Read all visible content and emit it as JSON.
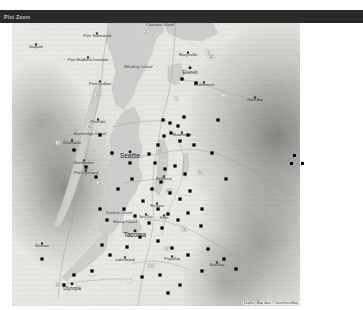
{
  "window": {
    "title": "Plot Zoom"
  },
  "map": {
    "attribution": "Leaflet | Map data © OpenStreetMap",
    "region_label": "Puget Sound, Washington",
    "major_cities": [
      {
        "name": "Seattle",
        "x": 118,
        "y": 135
      },
      {
        "name": "Tacoma",
        "x": 123,
        "y": 214
      },
      {
        "name": "Everett",
        "x": 178,
        "y": 51
      },
      {
        "name": "Olympia",
        "x": 60,
        "y": 267
      }
    ],
    "cities": [
      {
        "name": "Port Townsend",
        "x": 85,
        "y": 14
      },
      {
        "name": "Sequim",
        "x": 24,
        "y": 25
      },
      {
        "name": "Port Hadlock-Irondale",
        "x": 76,
        "y": 38
      },
      {
        "name": "Port Ludlow",
        "x": 88,
        "y": 62
      },
      {
        "name": "Poulsbo",
        "x": 86,
        "y": 100
      },
      {
        "name": "Bremerton",
        "x": 72,
        "y": 141
      },
      {
        "name": "Port Orchard",
        "x": 74,
        "y": 151
      },
      {
        "name": "Silverdale",
        "x": 60,
        "y": 121
      },
      {
        "name": "Marysville",
        "x": 176,
        "y": 33
      },
      {
        "name": "Snohomish",
        "x": 192,
        "y": 63
      },
      {
        "name": "Gold Bar",
        "x": 243,
        "y": 78
      },
      {
        "name": "Redmond",
        "x": 170,
        "y": 113
      },
      {
        "name": "Bellevue",
        "x": 152,
        "y": 157
      },
      {
        "name": "Renton",
        "x": 145,
        "y": 184
      },
      {
        "name": "SeaTac",
        "x": 134,
        "y": 195
      },
      {
        "name": "Kent",
        "x": 152,
        "y": 196
      },
      {
        "name": "Shelton",
        "x": 30,
        "y": 224
      },
      {
        "name": "Lakewood",
        "x": 113,
        "y": 238
      },
      {
        "name": "Puyallup",
        "x": 160,
        "y": 237
      },
      {
        "name": "Buckley",
        "x": 205,
        "y": 243
      }
    ],
    "geography": [
      {
        "name": "Camano Island",
        "x": 148,
        "y": 3
      },
      {
        "name": "Whidbey Island",
        "x": 126,
        "y": 45
      },
      {
        "name": "Bainbridge Island",
        "x": 78,
        "y": 112
      },
      {
        "name": "Vashon Island",
        "x": 107,
        "y": 191
      },
      {
        "name": "Maury Island",
        "x": 113,
        "y": 200
      }
    ],
    "route_shields": [
      {
        "label": "104",
        "x": 86,
        "y": 72
      },
      {
        "label": "305",
        "x": 78,
        "y": 104
      },
      {
        "label": "3",
        "x": 46,
        "y": 120
      },
      {
        "label": "16",
        "x": 88,
        "y": 160
      },
      {
        "label": "520",
        "x": 148,
        "y": 127
      },
      {
        "label": "90",
        "x": 188,
        "y": 150
      },
      {
        "label": "405",
        "x": 157,
        "y": 168
      },
      {
        "label": "18",
        "x": 172,
        "y": 207
      },
      {
        "label": "167",
        "x": 155,
        "y": 226
      },
      {
        "label": "512",
        "x": 139,
        "y": 243
      },
      {
        "label": "7",
        "x": 118,
        "y": 258
      },
      {
        "label": "101",
        "x": 46,
        "y": 262
      },
      {
        "label": "2",
        "x": 212,
        "y": 73
      },
      {
        "label": "9",
        "x": 196,
        "y": 30
      },
      {
        "label": "532",
        "x": 199,
        "y": 34
      },
      {
        "label": "20",
        "x": 134,
        "y": 9
      },
      {
        "label": "5",
        "x": 164,
        "y": 76
      }
    ],
    "data_points": [
      {
        "x": 151,
        "y": 97
      },
      {
        "x": 158,
        "y": 100
      },
      {
        "x": 166,
        "y": 103
      },
      {
        "x": 172,
        "y": 94
      },
      {
        "x": 159,
        "y": 110
      },
      {
        "x": 152,
        "y": 113
      },
      {
        "x": 168,
        "y": 118
      },
      {
        "x": 176,
        "y": 112
      },
      {
        "x": 182,
        "y": 122
      },
      {
        "x": 146,
        "y": 122
      },
      {
        "x": 137,
        "y": 131
      },
      {
        "x": 143,
        "y": 140
      },
      {
        "x": 153,
        "y": 146
      },
      {
        "x": 163,
        "y": 143
      },
      {
        "x": 173,
        "y": 151
      },
      {
        "x": 149,
        "y": 159
      },
      {
        "x": 140,
        "y": 166
      },
      {
        "x": 158,
        "y": 170
      },
      {
        "x": 168,
        "y": 176
      },
      {
        "x": 178,
        "y": 168
      },
      {
        "x": 131,
        "y": 178
      },
      {
        "x": 146,
        "y": 186
      },
      {
        "x": 156,
        "y": 191
      },
      {
        "x": 166,
        "y": 197
      },
      {
        "x": 123,
        "y": 193
      },
      {
        "x": 137,
        "y": 200
      },
      {
        "x": 150,
        "y": 205
      },
      {
        "x": 176,
        "y": 190
      },
      {
        "x": 190,
        "y": 186
      },
      {
        "x": 189,
        "y": 203
      },
      {
        "x": 95,
        "y": 197
      },
      {
        "x": 88,
        "y": 186
      },
      {
        "x": 112,
        "y": 186
      },
      {
        "x": 128,
        "y": 214
      },
      {
        "x": 146,
        "y": 218
      },
      {
        "x": 115,
        "y": 224
      },
      {
        "x": 98,
        "y": 232
      },
      {
        "x": 80,
        "y": 248
      },
      {
        "x": 62,
        "y": 252
      },
      {
        "x": 52,
        "y": 262
      },
      {
        "x": 160,
        "y": 225
      },
      {
        "x": 176,
        "y": 232
      },
      {
        "x": 196,
        "y": 226
      },
      {
        "x": 212,
        "y": 236
      },
      {
        "x": 224,
        "y": 246
      },
      {
        "x": 148,
        "y": 252
      },
      {
        "x": 130,
        "y": 254
      },
      {
        "x": 90,
        "y": 222
      },
      {
        "x": 184,
        "y": 60
      },
      {
        "x": 170,
        "y": 56
      },
      {
        "x": 206,
        "y": 97
      },
      {
        "x": 200,
        "y": 130
      },
      {
        "x": 214,
        "y": 156
      },
      {
        "x": 62,
        "y": 127
      },
      {
        "x": 74,
        "y": 144
      },
      {
        "x": 84,
        "y": 154
      },
      {
        "x": 106,
        "y": 166
      },
      {
        "x": 120,
        "y": 156
      },
      {
        "x": 118,
        "y": 140
      },
      {
        "x": 100,
        "y": 130
      },
      {
        "x": 88,
        "y": 112
      },
      {
        "x": 30,
        "y": 236
      },
      {
        "x": 190,
        "y": 248
      },
      {
        "x": 156,
        "y": 270
      },
      {
        "x": 168,
        "y": 262
      }
    ],
    "outlier_points": [
      {
        "x": 294,
        "y": 155
      },
      {
        "x": 291,
        "y": 163
      },
      {
        "x": 302,
        "y": 163
      }
    ]
  }
}
